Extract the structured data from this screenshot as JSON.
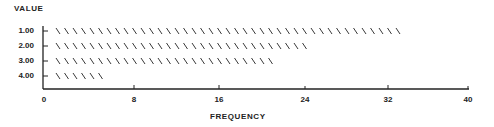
{
  "chart_data": {
    "type": "bar",
    "orientation": "horizontal",
    "bar_style": "backslash-hatch",
    "title": "",
    "ylabel": "VALUE",
    "xlabel": "FREQUENCY",
    "categories": [
      "1.00",
      "2.00",
      "3.00",
      "4.00"
    ],
    "values": [
      34,
      25,
      22,
      5
    ],
    "xlim": [
      0,
      40
    ],
    "xticks": [
      "0",
      "8",
      "16",
      "24",
      "32",
      "40"
    ],
    "grid": false,
    "legend": null
  },
  "labels": {
    "y_title": "VALUE",
    "x_title": "FREQUENCY",
    "y_ticks": [
      "1.00",
      "2.00",
      "3.00",
      "4.00"
    ],
    "x_ticks": [
      "0",
      "8",
      "16",
      "24",
      "32",
      "40"
    ]
  },
  "colors": {
    "ink": "#222222",
    "background": "#ffffff"
  }
}
